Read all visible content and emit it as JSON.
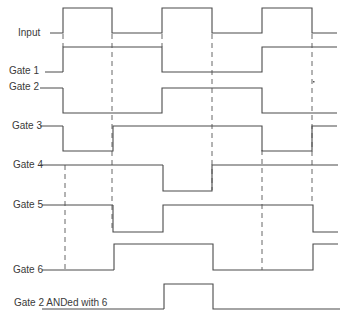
{
  "diagram": {
    "colors": {
      "line": "#4a4a4a",
      "text": "#3a3a3a",
      "background": "#ffffff"
    },
    "signals": [
      {
        "id": "input",
        "label": "Input",
        "label_x": 18,
        "label_y": 28,
        "lead": [
          50,
          33,
          62,
          33
        ],
        "points": [
          [
            62,
            33
          ],
          [
            63,
            33
          ],
          [
            63,
            8
          ],
          [
            112,
            8
          ],
          [
            112,
            33
          ],
          [
            162,
            33
          ],
          [
            162,
            8
          ],
          [
            212,
            8
          ],
          [
            212,
            33
          ],
          [
            262,
            33
          ],
          [
            262,
            8
          ],
          [
            312,
            8
          ],
          [
            312,
            33
          ],
          [
            337,
            33
          ]
        ]
      },
      {
        "id": "gate1",
        "label": "Gate 1",
        "label_x": 9,
        "label_y": 66,
        "lead": [
          45,
          72,
          63,
          72
        ],
        "points": [
          [
            63,
            72
          ],
          [
            63,
            47
          ],
          [
            162,
            47
          ],
          [
            162,
            72
          ],
          [
            262,
            72
          ],
          [
            262,
            47
          ],
          [
            337,
            47
          ]
        ]
      },
      {
        "id": "gate2",
        "label": "Gate 2",
        "label_x": 9,
        "label_y": 82,
        "lead": [
          40,
          88,
          63,
          88
        ],
        "points": [
          [
            63,
            88
          ],
          [
            63,
            113
          ],
          [
            162,
            113
          ],
          [
            162,
            88
          ],
          [
            262,
            88
          ],
          [
            262,
            113
          ],
          [
            337,
            113
          ]
        ]
      },
      {
        "id": "gate3",
        "label": "Gate 3",
        "label_x": 12,
        "label_y": 121,
        "lead": [
          40,
          126,
          63,
          126
        ],
        "points": [
          [
            63,
            126
          ],
          [
            63,
            151
          ],
          [
            113,
            151
          ],
          [
            113,
            126
          ],
          [
            262,
            126
          ],
          [
            262,
            151
          ],
          [
            312,
            151
          ],
          [
            312,
            126
          ],
          [
            337,
            126
          ]
        ]
      },
      {
        "id": "gate4",
        "label": "Gate 4",
        "label_x": 13,
        "label_y": 160,
        "lead": [
          40,
          165,
          163,
          165
        ],
        "points": [
          [
            163,
            165
          ],
          [
            163,
            191
          ],
          [
            212,
            191
          ],
          [
            212,
            165
          ],
          [
            338,
            165
          ]
        ]
      },
      {
        "id": "gate5",
        "label": "Gate 5",
        "label_x": 13,
        "label_y": 200,
        "lead": [
          42,
          205,
          113,
          205
        ],
        "points": [
          [
            113,
            205
          ],
          [
            113,
            232
          ],
          [
            163,
            232
          ],
          [
            163,
            205
          ],
          [
            313,
            205
          ],
          [
            313,
            232
          ],
          [
            338,
            232
          ]
        ]
      },
      {
        "id": "gate6",
        "label": "Gate 6",
        "label_x": 13,
        "label_y": 265,
        "lead": [
          42,
          270,
          114,
          270
        ],
        "points": [
          [
            114,
            270
          ],
          [
            114,
            244
          ],
          [
            213,
            244
          ],
          [
            213,
            270
          ],
          [
            313,
            270
          ],
          [
            313,
            244
          ],
          [
            338,
            244
          ]
        ]
      },
      {
        "id": "and26",
        "label": "Gate 2 ANDed with 6",
        "label_x": 14,
        "label_y": 298,
        "lead": [
          42,
          309,
          164,
          309
        ],
        "points": [
          [
            164,
            309
          ],
          [
            164,
            284
          ],
          [
            213,
            284
          ],
          [
            213,
            309
          ],
          [
            340,
            309
          ]
        ]
      }
    ],
    "dashed_lines": [
      [
        63,
        34,
        63,
        47
      ],
      [
        65,
        165,
        65,
        270
      ],
      [
        112,
        34,
        112,
        232
      ],
      [
        162,
        34,
        162,
        47
      ],
      [
        212,
        34,
        212,
        190
      ],
      [
        262,
        150,
        262,
        270
      ],
      [
        312,
        34,
        312,
        205
      ]
    ],
    "stray_marks": [
      [
        313,
        81
      ]
    ]
  }
}
